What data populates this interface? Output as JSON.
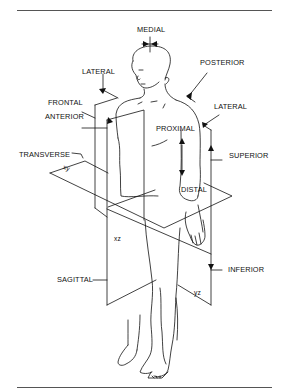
{
  "diagram": {
    "type": "anatomical-planes-and-directions",
    "labels": {
      "medial": "MEDIAL",
      "lateral_left": "LATERAL",
      "posterior": "POSTERIOR",
      "frontal": "FRONTAL",
      "anterior": "ANTERIOR",
      "lateral_right": "LATERAL",
      "proximal": "PROXIMAL",
      "distal": "DISTAL",
      "transverse": "TRANSVERSE",
      "superior": "SUPERIOR",
      "sagittal": "SAGITTAL",
      "inferior": "INFERIOR"
    },
    "plane_tags": {
      "xy": "xy",
      "xz": "xz",
      "yz": "yz"
    },
    "colors": {
      "line": "#111111",
      "rule": "#555555",
      "background": "#ffffff"
    }
  }
}
